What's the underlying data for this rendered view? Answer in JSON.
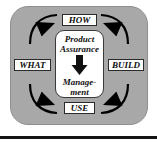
{
  "figure": {
    "name": "product-assurance-management-cycle",
    "panel_color": "#a8a8a8",
    "box_color": "#ffffff",
    "arrow_color": "#000000",
    "rule_color": "#141414"
  },
  "center": {
    "line1": "Product",
    "line2": "Assurance",
    "arrow_icon": "down-arrow-icon",
    "line3": "Manage-",
    "line4": "ment"
  },
  "labels": {
    "top": "HOW",
    "left": "WHAT",
    "right": "BUILD",
    "bottom": "USE"
  },
  "arrows": {
    "top_left": "curved-arrow-top-left",
    "top_right": "curved-arrow-top-right",
    "bottom_left": "curved-arrow-bottom-left",
    "bottom_right": "curved-arrow-bottom-right"
  }
}
